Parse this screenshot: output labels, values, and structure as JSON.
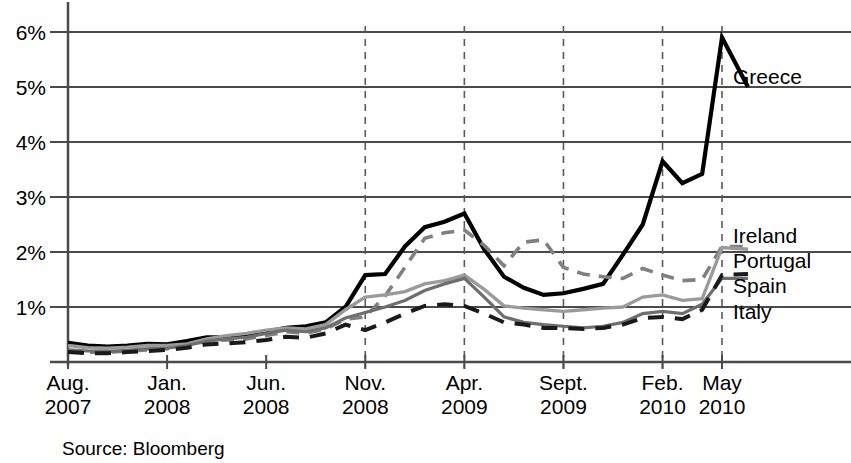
{
  "source_note": "Source: Bloomberg",
  "axes": {
    "y_ticks": [
      "1%",
      "2%",
      "3%",
      "4%",
      "5%",
      "6%"
    ],
    "x_ticks": [
      {
        "month": "Aug.",
        "year": "2007"
      },
      {
        "month": "Jan.",
        "year": "2008"
      },
      {
        "month": "Jun.",
        "year": "2008"
      },
      {
        "month": "Nov.",
        "year": "2008"
      },
      {
        "month": "Apr.",
        "year": "2009"
      },
      {
        "month": "Sept.",
        "year": "2009"
      },
      {
        "month": "Feb.",
        "year": "2010"
      },
      {
        "month": "May",
        "year": "2010"
      }
    ]
  },
  "series_labels": {
    "greece": "Greece",
    "ireland": "Ireland",
    "portugal": "Portugal",
    "spain": "Spain",
    "italy": "Italy"
  },
  "chart_data": {
    "type": "line",
    "title": "",
    "subtitle": "",
    "xlabel": "",
    "ylabel": "",
    "ylim": [
      0,
      6.4
    ],
    "ytick_values": [
      1,
      2,
      3,
      4,
      5,
      6
    ],
    "ytick_labels": [
      "1%",
      "2%",
      "3%",
      "4%",
      "5%",
      "6%"
    ],
    "grid": true,
    "legend_position": "right-inline-labels",
    "annotations": [
      "Source: Bloomberg"
    ],
    "vertical_reference_lines": [
      "Nov. 2008",
      "Apr. 2009",
      "Sept. 2009",
      "Feb. 2010",
      "May 2010"
    ],
    "x": [
      "Aug. 2007",
      "Sept. 2007",
      "Oct. 2007",
      "Nov. 2007",
      "Dec. 2007",
      "Jan. 2008",
      "Feb. 2008",
      "Mar. 2008",
      "Apr. 2008",
      "May 2008",
      "Jun. 2008",
      "Jul. 2008",
      "Aug. 2008",
      "Sept. 2008",
      "Oct. 2008",
      "Nov. 2008",
      "Dec. 2008",
      "Jan. 2009",
      "Feb. 2009",
      "Mar. 2009",
      "Apr. 2009",
      "May 2009",
      "Jun. 2009",
      "Jul. 2009",
      "Aug. 2009",
      "Sept. 2009",
      "Oct. 2009",
      "Nov. 2009",
      "Dec. 2009",
      "Jan. 2010",
      "Feb. 2010",
      "Mar. 2010",
      "Apr. 2010",
      "May 2010"
    ],
    "series": [
      {
        "name": "Greece",
        "style": "solid",
        "color": "#000000",
        "width": 4.2,
        "values": [
          0.35,
          0.3,
          0.28,
          0.3,
          0.33,
          0.32,
          0.38,
          0.45,
          0.45,
          0.48,
          0.55,
          0.62,
          0.65,
          0.72,
          1.0,
          1.58,
          1.6,
          2.1,
          2.45,
          2.55,
          2.7,
          2.05,
          1.55,
          1.35,
          1.22,
          1.25,
          1.33,
          1.42,
          1.95,
          2.5,
          3.65,
          3.25,
          3.42,
          5.9
        ],
        "end_value": 5.0
      },
      {
        "name": "Ireland",
        "style": "dashed",
        "color": "#808080",
        "width": 3.6,
        "values": [
          0.2,
          0.18,
          0.18,
          0.2,
          0.22,
          0.24,
          0.3,
          0.38,
          0.4,
          0.42,
          0.48,
          0.55,
          0.52,
          0.6,
          0.78,
          0.82,
          1.2,
          1.72,
          2.25,
          2.35,
          2.4,
          2.12,
          1.75,
          2.18,
          2.22,
          1.72,
          1.6,
          1.55,
          1.52,
          1.7,
          1.58,
          1.48,
          1.5,
          2.1
        ],
        "end_value": 2.1
      },
      {
        "name": "Portugal",
        "style": "solid",
        "color": "#9a9a9a",
        "width": 3.4,
        "values": [
          0.3,
          0.26,
          0.25,
          0.27,
          0.3,
          0.3,
          0.33,
          0.42,
          0.48,
          0.52,
          0.58,
          0.62,
          0.6,
          0.68,
          0.95,
          1.18,
          1.22,
          1.28,
          1.42,
          1.48,
          1.58,
          1.32,
          1.02,
          0.98,
          0.95,
          0.92,
          0.95,
          0.98,
          1.0,
          1.18,
          1.22,
          1.12,
          1.15,
          2.08
        ],
        "end_value": 2.05
      },
      {
        "name": "Spain",
        "style": "solid",
        "color": "#6e6e6e",
        "width": 3.2,
        "values": [
          0.22,
          0.2,
          0.19,
          0.21,
          0.24,
          0.25,
          0.3,
          0.38,
          0.42,
          0.45,
          0.52,
          0.58,
          0.55,
          0.62,
          0.8,
          0.9,
          1.0,
          1.12,
          1.3,
          1.42,
          1.52,
          1.18,
          0.82,
          0.72,
          0.68,
          0.65,
          0.62,
          0.65,
          0.72,
          0.88,
          0.92,
          0.88,
          1.05,
          1.52
        ],
        "end_value": 1.52
      },
      {
        "name": "Italy",
        "style": "long-dashed",
        "color": "#1a1a1a",
        "width": 4.0,
        "values": [
          0.18,
          0.16,
          0.16,
          0.18,
          0.2,
          0.22,
          0.26,
          0.32,
          0.34,
          0.36,
          0.4,
          0.46,
          0.44,
          0.52,
          0.68,
          0.58,
          0.72,
          0.88,
          1.02,
          1.05,
          1.02,
          0.88,
          0.72,
          0.68,
          0.62,
          0.62,
          0.6,
          0.62,
          0.68,
          0.8,
          0.82,
          0.78,
          0.95,
          1.58
        ],
        "end_value": 1.6
      }
    ]
  }
}
